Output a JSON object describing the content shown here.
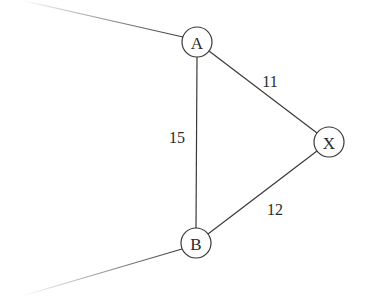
{
  "diagram": {
    "type": "weighted-graph",
    "nodes": [
      {
        "id": "A",
        "label": "A",
        "x": 197,
        "y": 42
      },
      {
        "id": "X",
        "label": "X",
        "x": 329,
        "y": 142
      },
      {
        "id": "B",
        "label": "B",
        "x": 196,
        "y": 243
      }
    ],
    "edges": [
      {
        "from": "A",
        "to": "X",
        "weight": "11"
      },
      {
        "from": "A",
        "to": "B",
        "weight": "15"
      },
      {
        "from": "B",
        "to": "X",
        "weight": "12"
      }
    ],
    "dangling_edges": [
      {
        "node": "A",
        "direction": "upper-left"
      },
      {
        "node": "B",
        "direction": "lower-left"
      }
    ],
    "colors": {
      "stroke": "#3a3a3a",
      "text": "#2a2a2a",
      "background": "#ffffff"
    }
  }
}
